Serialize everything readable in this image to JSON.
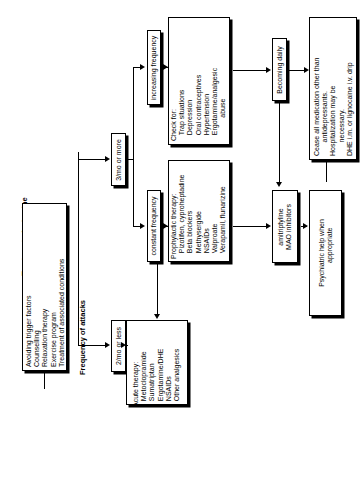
{
  "diagram": {
    "title": "Treatment of migraine",
    "orientation": "rotated-90-ccw",
    "nodes": {
      "general_measures": {
        "lines": "Avoiding trigger factors\nCounselling\nRelaxation therapy\nExercise program\nTreatment of associated conditions"
      },
      "decision": {
        "label": "Frequency of attacks"
      },
      "branch_low": {
        "label": "2/mo or less"
      },
      "branch_high": {
        "label": "3/mo or more"
      },
      "constant_frequency": {
        "label": "constant frequency"
      },
      "increasing_frequency": {
        "label": "increasing frequency"
      },
      "becoming_daily": {
        "label": "Becoming daily"
      },
      "acute_therapy": {
        "lines": "Acute therapy:\n   Metoclopramide\n   Sumatriptan\n   Ergotamine/DHE\n   NSAIDs\n   Other analgesics"
      },
      "prophylactic_therapy": {
        "lines": "Prophylactic therapy:\n   Pizotifen, cyproheptadine\n   Beta blockers\n   Methysergide\n   NSAIDs\n   Valproate\n   Verapamil, flunarizine"
      },
      "check_for": {
        "lines": "Check for:\n   Trap situations\n   Depression\n   Oral contraceptives\n   Hypertension\n   Ergotamine/analgesic\n            abuse"
      },
      "amitriptyline": {
        "lines": "amitriptyline\nMAO inhibitors"
      },
      "cease_medication": {
        "lines": "Cease all medication other than\n       antidepressants.\nHospitalization may be\n       necessary.\nDHE i.m. or lignocaine i.v. drip"
      },
      "psychiatric_help": {
        "lines": "Psychiatric help when\n        appropriate"
      }
    },
    "colors": {
      "stroke": "#000000",
      "background": "#ffffff",
      "shadow": "#000000"
    }
  }
}
